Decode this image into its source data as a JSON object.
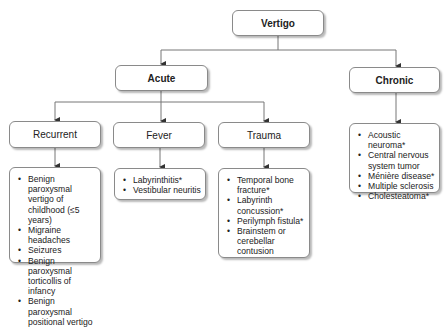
{
  "root": {
    "label": "Vertigo"
  },
  "categories": [
    {
      "label": "Acute"
    },
    {
      "label": "Chronic"
    }
  ],
  "acute_subtypes": [
    {
      "label": "Recurrent",
      "items": [
        "Benign paroxysmal vertigo of childhood (≤5 years)",
        "Migraine headaches",
        "Seizures",
        "Benign paroxysmal torticollis of infancy",
        "Benign paroxysmal positional vertigo"
      ]
    },
    {
      "label": "Fever",
      "items": [
        "Labyrinthitis*",
        "Vestibular neuritis"
      ]
    },
    {
      "label": "Trauma",
      "items": [
        "Temporal bone fracture*",
        "Labyrinth concussion*",
        "Perilymph fistula*",
        "Brainstem or cerebellar contusion"
      ]
    }
  ],
  "chronic_items": [
    "Acoustic neuroma*",
    "Central nervous system tumor",
    "Ménière disease*",
    "Multiple sclerosis",
    "Cholesteatoma*"
  ],
  "colors": {
    "border": "#8a8a8a",
    "line": "#777777",
    "arrow": "#333333"
  }
}
